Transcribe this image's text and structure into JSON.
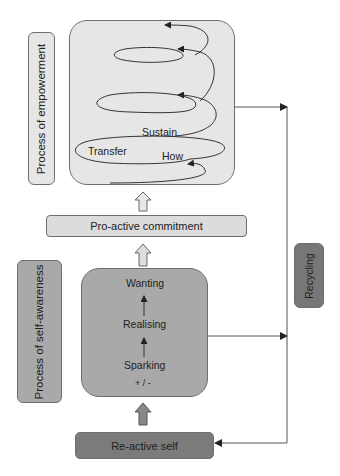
{
  "diagram": {
    "empowerment_box": {
      "label": "Process of empowerment",
      "stages": {
        "sustain": "Sustain",
        "transfer": "Transfer",
        "how": "How"
      },
      "color": "#e6e6e6"
    },
    "commitment": {
      "label": "Pro-active commitment",
      "color": "#dcdcdc"
    },
    "self_awareness_box": {
      "label": "Process of self-awareness",
      "stages": {
        "wanting": "Wanting",
        "realising": "Realising",
        "sparking": "Sparking",
        "polarity": "+ / -"
      },
      "color": "#a9a9a9"
    },
    "reactive_self": {
      "label": "Re-active self",
      "color": "#7b7b7b"
    },
    "recycling": {
      "label": "Recycling",
      "color": "#777777"
    }
  }
}
